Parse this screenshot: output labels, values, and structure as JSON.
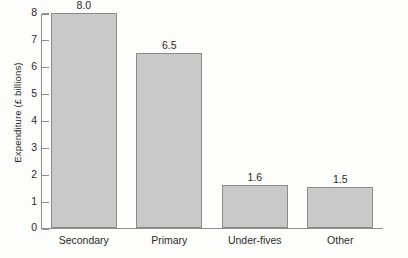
{
  "chart_data": {
    "type": "bar",
    "title": "",
    "xlabel": "",
    "ylabel": "Expenditure (£ billions)",
    "categories": [
      "Secondary",
      "Primary",
      "Under-fives",
      "Other"
    ],
    "values": [
      8.0,
      6.5,
      1.6,
      1.5
    ],
    "value_labels": [
      "8.0",
      "6.5",
      "1.6",
      "1.5"
    ],
    "ylim": [
      0,
      8
    ],
    "ytick_labels": [
      "0",
      "1",
      "2",
      "3",
      "4",
      "5",
      "6",
      "7",
      "8"
    ],
    "ytick_values": [
      0,
      1,
      2,
      3,
      4,
      5,
      6,
      7,
      8
    ],
    "grid": false,
    "legend": false,
    "bar_fill_color": "#c9c9c9",
    "bar_edge_color": "#8a8a8a",
    "axis_color": "#8e8e8e",
    "text_color": "#2a2a2a",
    "background_color": "#fdfdfb"
  }
}
